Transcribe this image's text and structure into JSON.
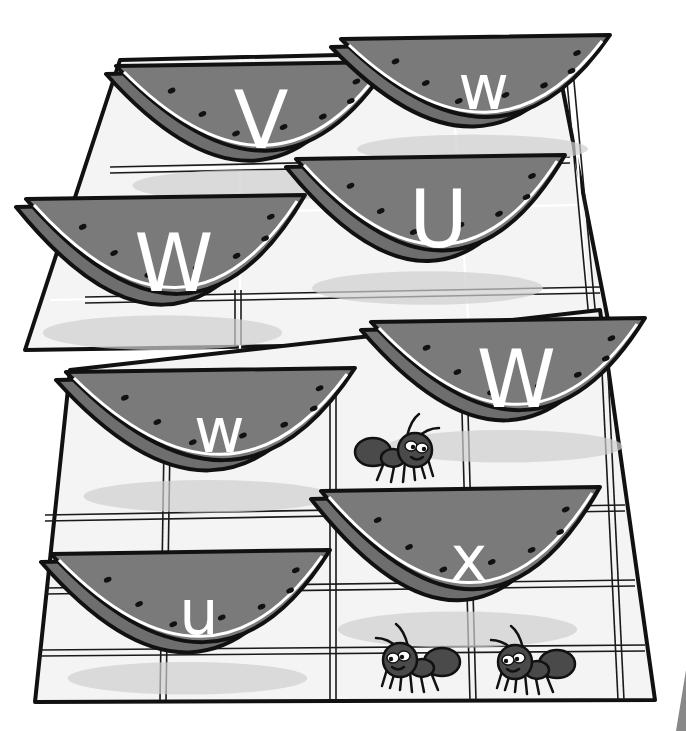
{
  "scene": {
    "description": "Picnic blankets with watermelon slices labeled with letters, plus cartoon ants",
    "colors": {
      "flesh": "#7a7a7a",
      "rind": "#6e6e6e",
      "outline": "#111111",
      "cloth": "#f4f4f4",
      "letter": "#ffffff"
    }
  },
  "watermelons": [
    {
      "id": "slice-1",
      "letter": "V",
      "case": "upper",
      "x": 110,
      "y": 62,
      "w": 280,
      "h": 130
    },
    {
      "id": "slice-2",
      "letter": "w",
      "case": "lower",
      "x": 335,
      "y": 35,
      "w": 275,
      "h": 120
    },
    {
      "id": "slice-3",
      "letter": "U",
      "case": "upper",
      "x": 290,
      "y": 155,
      "w": 275,
      "h": 140
    },
    {
      "id": "slice-4",
      "letter": "W",
      "case": "upper",
      "x": 20,
      "y": 195,
      "w": 285,
      "h": 145
    },
    {
      "id": "slice-5",
      "letter": "W",
      "case": "upper",
      "x": 365,
      "y": 318,
      "w": 280,
      "h": 135
    },
    {
      "id": "slice-6",
      "letter": "w",
      "case": "lower",
      "x": 60,
      "y": 368,
      "w": 295,
      "h": 135
    },
    {
      "id": "slice-7",
      "letter": "x",
      "case": "lower",
      "x": 315,
      "y": 487,
      "w": 285,
      "h": 150
    },
    {
      "id": "slice-8",
      "letter": "u",
      "case": "lower",
      "x": 45,
      "y": 550,
      "w": 285,
      "h": 135
    }
  ],
  "ants": [
    {
      "id": "ant-1",
      "x": 405,
      "y": 450,
      "facing": "right"
    },
    {
      "id": "ant-2",
      "x": 410,
      "y": 660,
      "facing": "left"
    },
    {
      "id": "ant-3",
      "x": 525,
      "y": 662,
      "facing": "left"
    }
  ],
  "blankets": [
    {
      "id": "upper-blanket"
    },
    {
      "id": "lower-blanket"
    }
  ]
}
